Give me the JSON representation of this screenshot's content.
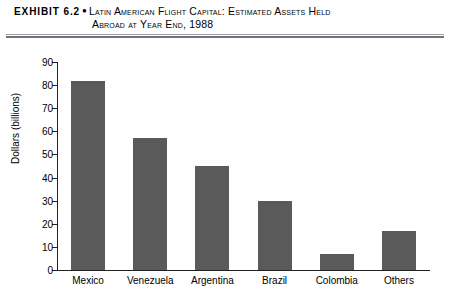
{
  "header": {
    "exhibit_tag": "EXHIBIT 6.2",
    "bullet": "●",
    "title_line_1": "Latin American Flight Capital: Estimated Assets Held",
    "title_line_2": "Abroad at Year End, 1988"
  },
  "chart_data": {
    "type": "bar",
    "title": "Latin American Flight Capital: Estimated Assets Held Abroad at Year End, 1988",
    "categories": [
      "Mexico",
      "Venezuela",
      "Argentina",
      "Brazil",
      "Colombia",
      "Others"
    ],
    "values": [
      82,
      57,
      45,
      30,
      7,
      17
    ],
    "xlabel": "",
    "ylabel": "Dollars (billions)",
    "ylim": [
      0,
      90
    ],
    "ytick_step": 10,
    "yticks": [
      0,
      10,
      20,
      30,
      40,
      50,
      60,
      70,
      80,
      90
    ],
    "ytick_labels": [
      "0",
      "10",
      "20",
      "30",
      "40",
      "50",
      "60",
      "70",
      "80",
      "90"
    ],
    "grid": false,
    "legend": false,
    "bar_color": "#5a5a5a",
    "axis_color": "#222222",
    "background": "#ffffff"
  }
}
